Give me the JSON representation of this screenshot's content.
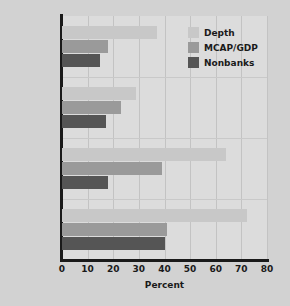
{
  "chart_data": {
    "type": "bar",
    "orientation": "horizontal",
    "title": "",
    "xlabel": "Percent",
    "ylabel": "",
    "xlim": [
      0,
      80
    ],
    "xticks": [
      0,
      10,
      20,
      30,
      40,
      50,
      60,
      70,
      80
    ],
    "categories": [
      "Africa",
      "Latin\nAmerica",
      "Asia",
      "Industrial"
    ],
    "grid": "vertical",
    "legend_position": "top-right",
    "series": [
      {
        "name": "Depth",
        "color": "#c8c8c8",
        "values": [
          37,
          29,
          64,
          72
        ]
      },
      {
        "name": "MCAP/GDP",
        "color": "#9a9a9a",
        "values": [
          18,
          23,
          39,
          41
        ]
      },
      {
        "name": "Nonbanks",
        "color": "#555555",
        "values": [
          15,
          17,
          18,
          40
        ]
      }
    ]
  },
  "figure": {
    "background_color": "#d2d2d2",
    "plot_background_color": "#dcdcdc",
    "axis_color": "#1a1a1a"
  }
}
